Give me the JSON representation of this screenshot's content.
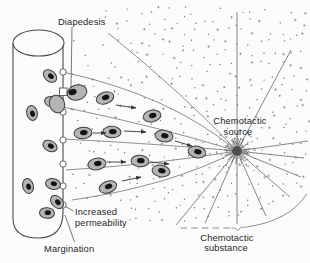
{
  "figure": {
    "labels": {
      "diapedesis": "Diapedesis",
      "chemotactic_source_line1": "Chemotactic",
      "chemotactic_source_line2": "source",
      "increased_permeability_line1": "Increased",
      "increased_permeability_line2": "permeability",
      "margination": "Margination",
      "chemotactic_substance_line1": "Chemotactic",
      "chemotactic_substance_line2": "substance"
    },
    "colors": {
      "background": "#fbfbfb",
      "cell_fill": "#b4b4b4",
      "cell_stroke": "#3d3d3d",
      "nucleus": "#141414",
      "gradient_line": "#757575",
      "ray": "#6a6a6a",
      "vessel_stroke": "#4a4a4a",
      "source_fill": "#4f4f4f",
      "source_halo": "#9a9a9a",
      "dot": "#4f4f4f",
      "plus_mark": "#6e6e6e",
      "boundary": "#808080",
      "text": "#1f1f1f"
    },
    "source": {
      "x": 237,
      "y": 151,
      "r": 5,
      "halo_r": 8.5,
      "spike_angles": [
        95,
        115,
        135,
        160,
        185,
        205,
        225,
        250,
        275,
        300,
        325,
        350,
        15,
        55
      ],
      "spike_inner": 5.5,
      "spike_outer": 13
    },
    "vessel": {
      "ellipse": {
        "cx": 38.5,
        "cy": 43,
        "rx": 25.5,
        "ry": 13
      },
      "body_path": "M13,43 L13,218 Q13,238 38,238 Q63,238 63,212 L63,43"
    },
    "wall_gaps": [
      {
        "x": 63,
        "y": 72
      },
      {
        "x": 63,
        "y": 112
      },
      {
        "x": 63,
        "y": 140
      },
      {
        "x": 63,
        "y": 164
      },
      {
        "x": 63,
        "y": 186
      },
      {
        "x": 63,
        "y": 205
      }
    ],
    "diapedesis_gap": {
      "x": 59.5,
      "y": 88,
      "w": 7.5,
      "h": 7.5
    },
    "diapedesis_cell": {
      "inner_lobe": {
        "x": 57,
        "y": 104,
        "rx": 7.5,
        "ry": 9,
        "rot": -20
      },
      "outer_lobe": {
        "x": 77,
        "y": 92.5,
        "rx": 10,
        "ry": 7.5,
        "rot": -15
      },
      "nucleus": {
        "x": 72.5,
        "y": 92,
        "rx": 4.2,
        "ry": 3,
        "rot": -15
      }
    },
    "interior_cells": [
      {
        "x": 50,
        "y": 76,
        "rot": 40
      },
      {
        "x": 32,
        "y": 113,
        "rot": 78
      },
      {
        "x": 52,
        "y": 102,
        "rot": 15
      },
      {
        "x": 50,
        "y": 146,
        "rot": 28
      },
      {
        "x": 28,
        "y": 186,
        "rot": 75
      },
      {
        "x": 53,
        "y": 184,
        "rot": 12
      },
      {
        "x": 57,
        "y": 202,
        "rot": 45
      },
      {
        "x": 47,
        "y": 213,
        "rot": 5
      }
    ],
    "migrating_cells": [
      {
        "x": 105,
        "y": 98,
        "rot": -18
      },
      {
        "x": 152,
        "y": 116,
        "rot": -12
      },
      {
        "x": 83,
        "y": 133,
        "rot": -5
      },
      {
        "x": 112,
        "y": 132,
        "rot": 3
      },
      {
        "x": 164,
        "y": 136,
        "rot": 8
      },
      {
        "x": 197,
        "y": 152,
        "rot": 12
      },
      {
        "x": 97,
        "y": 164,
        "rot": -8
      },
      {
        "x": 140,
        "y": 161,
        "rot": 4
      },
      {
        "x": 161,
        "y": 171,
        "rot": 10
      },
      {
        "x": 108,
        "y": 187,
        "rot": -20
      }
    ],
    "arrows": [
      {
        "x1": 116,
        "y1": 105,
        "x2": 136,
        "y2": 108
      },
      {
        "x1": 93,
        "y1": 133,
        "x2": 106,
        "y2": 133
      },
      {
        "x1": 124,
        "y1": 131,
        "x2": 146,
        "y2": 132
      },
      {
        "x1": 175,
        "y1": 141,
        "x2": 192,
        "y2": 146
      },
      {
        "x1": 107,
        "y1": 162,
        "x2": 126,
        "y2": 162
      },
      {
        "x1": 150,
        "y1": 162,
        "x2": 169,
        "y2": 164
      },
      {
        "x1": 122,
        "y1": 181,
        "x2": 141,
        "y2": 177
      }
    ],
    "gradient_lines": [
      "M108,33 Q185,95 237,151",
      "M63,72 Q170,95 237,151",
      "M63,107 Q160,127 237,151",
      "M63,139 Q160,144 237,151",
      "M66,170 Q160,164 237,151",
      "M72,200 Q170,186 237,151"
    ],
    "rays": [
      {
        "x": 237,
        "y": 12
      },
      {
        "x": 291,
        "y": 50
      },
      {
        "x": 308,
        "y": 141
      },
      {
        "x": 304,
        "y": 158
      },
      {
        "x": 301,
        "y": 177
      },
      {
        "x": 290,
        "y": 197
      },
      {
        "x": 266,
        "y": 216
      },
      {
        "x": 237,
        "y": 224
      },
      {
        "x": 205,
        "y": 223
      },
      {
        "x": 176,
        "y": 225
      }
    ],
    "boundary": {
      "dashed": {
        "x1": 180.5,
        "y1": 228,
        "x2": 231,
        "y2": 228,
        "dash": "6.5 4.2"
      },
      "brace_path": "M231.5,228.2 Q235.5,226.5 237.8,230.8 Q240,226.5 245.5,227.2",
      "curve_path": "M245.5,227.2 Q290,221 307,193.5"
    },
    "pointers": {
      "diapedesis": {
        "x1": 72,
        "y1": 27,
        "x2": 71,
        "y2": 88
      },
      "source_a": {
        "x1": 234,
        "y1": 138,
        "x2": 236.5,
        "y2": 144
      },
      "source_b": {
        "x1": 241,
        "y1": 138,
        "x2": 238.5,
        "y2": 144
      },
      "increased": {
        "x1": 73.5,
        "y1": 211,
        "x2": 65.5,
        "y2": 206.5
      },
      "margination": {
        "x1": 65,
        "y1": 215,
        "x2": 74.5,
        "y2": 242
      }
    },
    "stipple": {
      "seed": 7,
      "grid_step": 11,
      "jitter": 4.5,
      "halo_count": 62
    }
  }
}
